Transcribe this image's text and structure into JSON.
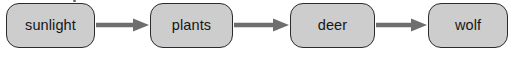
{
  "diagram": {
    "type": "linear-flow-chain",
    "background_color": "#ffffff",
    "node_fill_color": "#cdcdcd",
    "node_border_color": "#2b2b2b",
    "arrow_color": "#6e6e6e",
    "text_color": "#161616",
    "nodes": [
      {
        "id": "sunlight",
        "label": "sunlight",
        "x": 6,
        "y": 3,
        "w": 89,
        "h": 45
      },
      {
        "id": "plants",
        "label": "plants",
        "x": 150,
        "y": 3,
        "w": 83,
        "h": 45
      },
      {
        "id": "deer",
        "label": "deer",
        "x": 290,
        "y": 3,
        "w": 85,
        "h": 45
      },
      {
        "id": "wolf",
        "label": "wolf",
        "x": 428,
        "y": 3,
        "w": 80,
        "h": 45
      }
    ],
    "edges": [
      {
        "id": "edge-sunlight-plants",
        "from": "sunlight",
        "to": "plants",
        "x1": 96,
        "x2": 149,
        "y": 25
      },
      {
        "id": "edge-plants-deer",
        "from": "plants",
        "to": "deer",
        "x1": 234,
        "x2": 289,
        "y": 25
      },
      {
        "id": "edge-deer-wolf",
        "from": "deer",
        "to": "wolf",
        "x1": 376,
        "x2": 427,
        "y": 25
      }
    ],
    "artifacts": [
      {
        "id": "scan-speck",
        "x": 73,
        "y": 0,
        "w": 3,
        "h": 2
      }
    ]
  }
}
